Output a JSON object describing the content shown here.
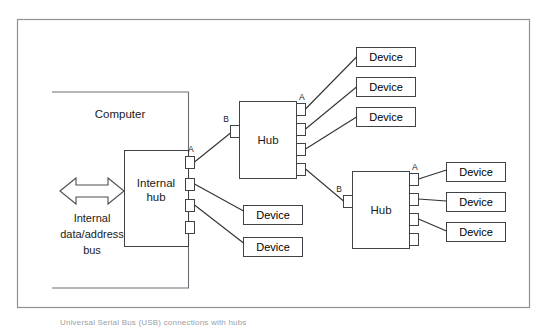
{
  "figure": {
    "caption": "Universal Serial Bus (USB) connections with hubs",
    "background_color": "#ffffff",
    "frame_color": "#8d9296",
    "line_color": "#2f3336"
  },
  "computer": {
    "label": "Computer",
    "internal_hub": {
      "label_line1": "Internal",
      "label_line2": "hub",
      "ports": [
        {
          "name": "port-a",
          "label": "A",
          "connected": true
        },
        {
          "name": "port-2",
          "label": "",
          "connected": true
        },
        {
          "name": "port-3",
          "label": "",
          "connected": true
        },
        {
          "name": "port-4",
          "label": "",
          "connected": false
        }
      ]
    },
    "bus": {
      "line1": "Internal",
      "line2": "data/address",
      "line3": "bus",
      "arrow": "double-headed"
    }
  },
  "hubs": [
    {
      "id": "hub-top",
      "label": "Hub",
      "upstream_port": {
        "label": "B"
      },
      "downstream_ports": [
        {
          "label": "A",
          "connected": true
        },
        {
          "label": "",
          "connected": true
        },
        {
          "label": "",
          "connected": true
        },
        {
          "label": "",
          "connected": true
        }
      ]
    },
    {
      "id": "hub-bottom",
      "label": "Hub",
      "upstream_port": {
        "label": "B"
      },
      "downstream_ports": [
        {
          "label": "A",
          "connected": true
        },
        {
          "label": "",
          "connected": true
        },
        {
          "label": "",
          "connected": true
        },
        {
          "label": "",
          "connected": false
        }
      ]
    }
  ],
  "devices": [
    {
      "id": "device-1",
      "label": "Device",
      "parent": "hub-top"
    },
    {
      "id": "device-2",
      "label": "Device",
      "parent": "hub-top"
    },
    {
      "id": "device-3",
      "label": "Device",
      "parent": "hub-top"
    },
    {
      "id": "device-4",
      "label": "Device",
      "parent": "internal-hub"
    },
    {
      "id": "device-5",
      "label": "Device",
      "parent": "internal-hub"
    },
    {
      "id": "device-6",
      "label": "Device",
      "parent": "hub-bottom"
    },
    {
      "id": "device-7",
      "label": "Device",
      "parent": "hub-bottom"
    },
    {
      "id": "device-8",
      "label": "Device",
      "parent": "hub-bottom"
    }
  ]
}
